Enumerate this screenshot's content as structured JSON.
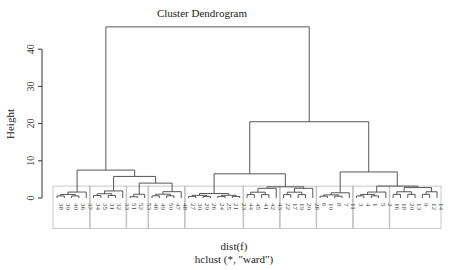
{
  "chart_data": {
    "type": "dendrogram",
    "title": "Cluster Dendrogram",
    "xlabel": "dist(f)",
    "sublabel": "hclust (*, \"ward\")",
    "ylabel": "Height",
    "ylim": [
      0,
      46
    ],
    "yticks": [
      0,
      10,
      20,
      30,
      40
    ],
    "labels": [
      "38",
      "39",
      "40",
      "36",
      "37",
      "34",
      "35",
      "31",
      "32",
      "33",
      "51",
      "52",
      "53",
      "46",
      "49",
      "50",
      "47",
      "48",
      "27",
      "30",
      "29",
      "26",
      "24",
      "25",
      "21",
      "23",
      "44",
      "45",
      "41",
      "42",
      "43",
      "22",
      "17",
      "19",
      "20",
      "28",
      "6",
      "10",
      "8",
      "7",
      "11",
      "3",
      "4",
      "1",
      "5",
      "2",
      "16",
      "18",
      "20",
      "13",
      "9",
      "12",
      "14"
    ],
    "clusters": [
      {
        "members": [
          0,
          1,
          2,
          3,
          4
        ],
        "height": 1.6
      },
      {
        "members": [
          5,
          6,
          7,
          8,
          9
        ],
        "height": 1.9
      },
      {
        "members": [
          10,
          11,
          12
        ],
        "height": 1.0
      },
      {
        "members": [
          13,
          14,
          15,
          16,
          17
        ],
        "height": 1.7
      },
      {
        "members": [
          18,
          19,
          20,
          21,
          22,
          23,
          24,
          25
        ],
        "height": 1.2
      },
      {
        "members": [
          26,
          27,
          28,
          29,
          30
        ],
        "height": 2.6
      },
      {
        "members": [
          31,
          32,
          33,
          34,
          35
        ],
        "height": 2.6
      },
      {
        "members": [
          36,
          37,
          38,
          39,
          40
        ],
        "height": 1.4
      },
      {
        "members": [
          41,
          42,
          43,
          44,
          45
        ],
        "height": 1.6
      },
      {
        "members": [
          46,
          47,
          48,
          49,
          50,
          51,
          52
        ],
        "height": 2.8
      }
    ],
    "merges": [
      {
        "a": "c2",
        "b": "c3",
        "height": 4.0,
        "id": "m1"
      },
      {
        "a": "c1",
        "b": "m1",
        "height": 5.8,
        "id": "m2"
      },
      {
        "a": "c0",
        "b": "m2",
        "height": 7.5,
        "id": "m3"
      },
      {
        "a": "c5",
        "b": "c6",
        "height": 3.0,
        "id": "m4"
      },
      {
        "a": "c4",
        "b": "m4",
        "height": 6.5,
        "id": "m5"
      },
      {
        "a": "c8",
        "b": "c9",
        "height": 3.2,
        "id": "m6"
      },
      {
        "a": "c7",
        "b": "m6",
        "height": 7.0,
        "id": "m7"
      },
      {
        "a": "m5",
        "b": "m7",
        "height": 20.5,
        "id": "m8"
      },
      {
        "a": "m3",
        "b": "m8",
        "height": 46.0,
        "id": "m9"
      }
    ],
    "rect_groups": 10
  }
}
